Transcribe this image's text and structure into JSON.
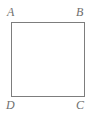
{
  "figure": {
    "kind": "geometry-diagram",
    "shape_name": "square-abcd",
    "background_color": "#ffffff",
    "stroke_color": "#7d7d7d",
    "label_color": "#6e6e6e",
    "vertices": [
      {
        "id": "a",
        "label": "A",
        "position": "top-left"
      },
      {
        "id": "b",
        "label": "B",
        "position": "top-right"
      },
      {
        "id": "c",
        "label": "C",
        "position": "bottom-right"
      },
      {
        "id": "d",
        "label": "D",
        "position": "bottom-left"
      }
    ]
  }
}
